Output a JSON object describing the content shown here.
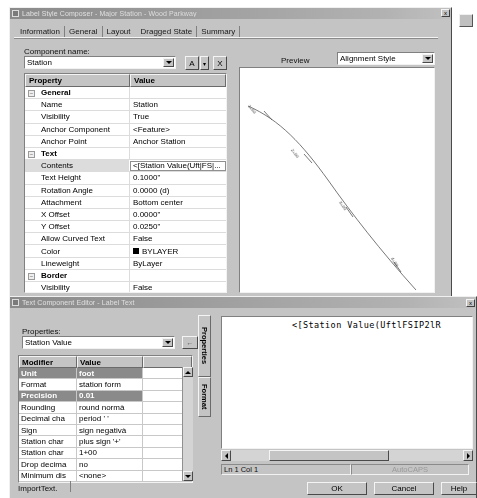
{
  "label_style_dialog": {
    "title": "Label Style Composer - Major Station - Wood Parkway",
    "close_label": "x",
    "tabs": [
      {
        "label": "Information",
        "selected": false
      },
      {
        "label": "General",
        "selected": false
      },
      {
        "label": "Layout",
        "selected": true
      },
      {
        "label": "Dragged State",
        "selected": false
      },
      {
        "label": "Summary",
        "selected": false
      }
    ],
    "component_name_label": "Component name:",
    "component_name_value": "Station",
    "buttons": {
      "text_style": "A",
      "text_style_dropdown": "▾",
      "delete": "X"
    },
    "grid": {
      "headers": [
        "Property",
        "Value"
      ],
      "rows": [
        {
          "category": true,
          "property": "General",
          "value": ""
        },
        {
          "property": "Name",
          "value": "Station"
        },
        {
          "property": "Visibility",
          "value": "True"
        },
        {
          "property": "Anchor Component",
          "value": "<Feature>"
        },
        {
          "property": "Anchor Point",
          "value": "Anchor Station"
        },
        {
          "category": true,
          "property": "Text",
          "value": ""
        },
        {
          "property": "Contents",
          "value": "<[Station Value(Uft|FS|...",
          "selected": true
        },
        {
          "property": "Text Height",
          "value": "0.1000\""
        },
        {
          "property": "Rotation Angle",
          "value": "0.0000 (d)"
        },
        {
          "property": "Attachment",
          "value": "Bottom center"
        },
        {
          "property": "X Offset",
          "value": "0.0000\""
        },
        {
          "property": "Y Offset",
          "value": "0.0250\""
        },
        {
          "property": "Allow Curved Text",
          "value": "False"
        },
        {
          "property": "Color",
          "value": "BYLAYER",
          "swatch": "#000000"
        },
        {
          "property": "Lineweight",
          "value": "ByLayer"
        },
        {
          "category": true,
          "property": "Border",
          "value": ""
        },
        {
          "property": "Visibility",
          "value": "False"
        },
        {
          "property": "Type",
          "value": "Rectangular"
        },
        {
          "property": "Gap",
          "value": "0.0250\""
        },
        {
          "property": "Color",
          "value": "BYLAYER",
          "swatch": "#000000"
        },
        {
          "property": "Linetype",
          "value": "ByBlock"
        }
      ]
    },
    "preview": {
      "label": "Preview",
      "mode_value": "Alignment Style",
      "station_labels": [
        "1+00",
        "2+00",
        "3+00",
        "4+00"
      ]
    }
  },
  "text_component_editor": {
    "title": "Text Component Editor - Label Text",
    "close_label": "x",
    "vertical_tabs": [
      {
        "label": "Properties",
        "selected": true
      },
      {
        "label": "Format",
        "selected": false
      }
    ],
    "properties_label": "Properties:",
    "properties_value": "Station Value",
    "insert_button_label": "←",
    "modifier_grid": {
      "headers": [
        "Modifier",
        "Value",
        ""
      ],
      "rows": [
        {
          "modifier": "Unit",
          "value": "foot",
          "selected": true
        },
        {
          "modifier": "Format",
          "value": "station form"
        },
        {
          "modifier": "Precision",
          "value": "0.01",
          "selected": true
        },
        {
          "modifier": "Rounding",
          "value": "round normà"
        },
        {
          "modifier": "Decimal cha",
          "value": "period ' '"
        },
        {
          "modifier": "Sign",
          "value": "sign negativà"
        },
        {
          "modifier": "Station char",
          "value": "plus sign '+'"
        },
        {
          "modifier": "Station char",
          "value": "1+00"
        },
        {
          "modifier": "Drop decima",
          "value": "no"
        },
        {
          "modifier": "Minimum dis",
          "value": "<none>"
        }
      ]
    },
    "editor_text": "<[Station Value(UftlFSIP2lR",
    "status": {
      "caret": "Ln 1 Col 1",
      "autocaps": "AutoCAPS"
    },
    "import_text_label": "ImportText.",
    "footer_buttons": [
      {
        "label": "OK"
      },
      {
        "label": "Cancel"
      },
      {
        "label": "Help"
      }
    ]
  },
  "colors": {
    "face": "#c4c4c4",
    "title_active": "#8a8a8a",
    "selection": "#8a8a8a",
    "highlight_row": "#dcdcdc"
  }
}
